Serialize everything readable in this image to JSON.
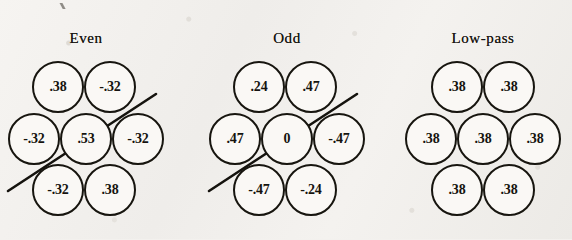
{
  "figure": {
    "type": "diagram",
    "background_color": "#f1efec",
    "ink_color": "#15130e",
    "cell_fill_color": "#faf8f5"
  },
  "groups": [
    {
      "id": "even",
      "title": "Even",
      "title_x": 86,
      "has_diagonal_line": true,
      "diagonal_line": {
        "x1": 8,
        "y1": 191,
        "x2": 156,
        "y2": 94
      },
      "cells": [
        {
          "name": "top-left",
          "value": ".38",
          "cx": 58,
          "cy": 87
        },
        {
          "name": "top-right",
          "value": "-.32",
          "cx": 110,
          "cy": 87
        },
        {
          "name": "middle-left",
          "value": "-.32",
          "cx": 34,
          "cy": 139
        },
        {
          "name": "center",
          "value": ".53",
          "cx": 86,
          "cy": 139
        },
        {
          "name": "middle-right",
          "value": "-.32",
          "cx": 138,
          "cy": 139
        },
        {
          "name": "bottom-left",
          "value": "-.32",
          "cx": 58,
          "cy": 190
        },
        {
          "name": "bottom-right",
          "value": ".38",
          "cx": 110,
          "cy": 190
        }
      ]
    },
    {
      "id": "odd",
      "title": "Odd",
      "title_x": 287,
      "has_diagonal_line": true,
      "diagonal_line": {
        "x1": 209,
        "y1": 191,
        "x2": 357,
        "y2": 94
      },
      "cells": [
        {
          "name": "top-left",
          "value": ".24",
          "cx": 259,
          "cy": 87
        },
        {
          "name": "top-right",
          "value": ".47",
          "cx": 311,
          "cy": 87
        },
        {
          "name": "middle-left",
          "value": ".47",
          "cx": 235,
          "cy": 139
        },
        {
          "name": "center",
          "value": "0",
          "cx": 287,
          "cy": 139
        },
        {
          "name": "middle-right",
          "value": "-.47",
          "cx": 339,
          "cy": 139
        },
        {
          "name": "bottom-left",
          "value": "-.47",
          "cx": 259,
          "cy": 190
        },
        {
          "name": "bottom-right",
          "value": "-.24",
          "cx": 311,
          "cy": 190
        }
      ]
    },
    {
      "id": "low-pass",
      "title": "Low-pass",
      "title_x": 483,
      "has_diagonal_line": false,
      "cells": [
        {
          "name": "top-left",
          "value": ".38",
          "cx": 457,
          "cy": 87
        },
        {
          "name": "top-right",
          "value": ".38",
          "cx": 509,
          "cy": 87
        },
        {
          "name": "middle-left",
          "value": ".38",
          "cx": 431,
          "cy": 139
        },
        {
          "name": "center",
          "value": ".38",
          "cx": 483,
          "cy": 139
        },
        {
          "name": "middle-right",
          "value": ".38",
          "cx": 535,
          "cy": 139
        },
        {
          "name": "bottom-left",
          "value": ".38",
          "cx": 457,
          "cy": 190
        },
        {
          "name": "bottom-right",
          "value": ".38",
          "cx": 509,
          "cy": 190
        }
      ]
    }
  ],
  "layout": {
    "cell_diameter": 52,
    "title_y": 30
  }
}
